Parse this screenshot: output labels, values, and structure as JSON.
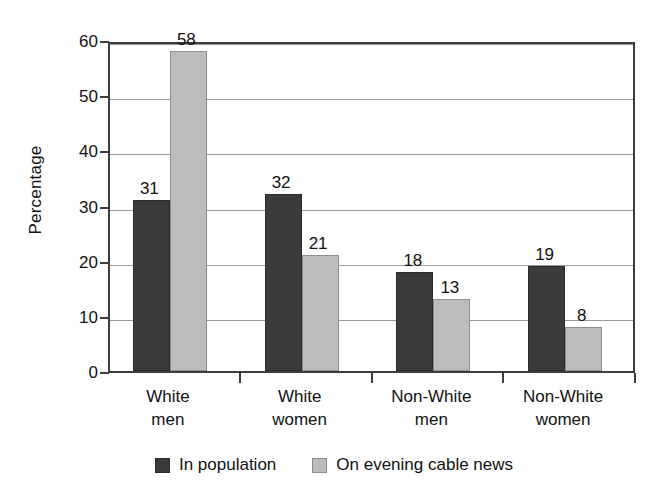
{
  "chart_data": {
    "type": "bar",
    "title": "",
    "xlabel": "",
    "ylabel": "Percentage",
    "ylim": [
      0,
      60
    ],
    "ytick_step": 10,
    "yticks": [
      "0",
      "10",
      "20",
      "30",
      "40",
      "50",
      "60"
    ],
    "grid": true,
    "legend_position": "bottom",
    "categories": [
      "White men",
      "White women",
      "Non-White men",
      "Non-White women"
    ],
    "category_lines": [
      [
        "White",
        "men"
      ],
      [
        "White",
        "women"
      ],
      [
        "Non-White",
        "men"
      ],
      [
        "Non-White",
        "women"
      ]
    ],
    "series": [
      {
        "name": "In population",
        "color": "#3b3b3b",
        "values": [
          31,
          32,
          18,
          19
        ],
        "labels": [
          "31",
          "32",
          "18",
          "19"
        ]
      },
      {
        "name": "On evening cable news",
        "color": "#bdbdbd",
        "values": [
          58,
          21,
          13,
          8
        ],
        "labels": [
          "58",
          "21",
          "13",
          "8"
        ]
      }
    ]
  }
}
